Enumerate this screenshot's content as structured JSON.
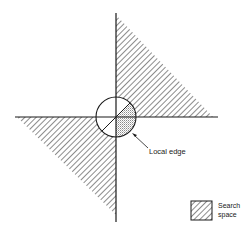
{
  "diagram": {
    "type": "search-space-illustration",
    "colors": {
      "line": "#1a1a1a",
      "background": "#ffffff",
      "stipple": "#9a9a9a"
    },
    "regions": [
      {
        "name": "upper-right-search-region",
        "fill": "hatched",
        "vertices": [
          [
            116,
            15
          ],
          [
            116,
            117
          ],
          [
            213,
            117
          ]
        ]
      },
      {
        "name": "lower-left-search-region",
        "fill": "hatched",
        "vertices": [
          [
            17,
            117
          ],
          [
            116,
            117
          ],
          [
            116,
            215
          ]
        ]
      }
    ],
    "center_circle": {
      "cx": 116,
      "cy": 117,
      "r": 20,
      "shaded_wedge": "stippled lower-right sector"
    },
    "annotations": {
      "local_edge_label": "Local edge"
    },
    "legend": {
      "line1": "Search",
      "line2": "space",
      "swatch": "hatched"
    }
  }
}
